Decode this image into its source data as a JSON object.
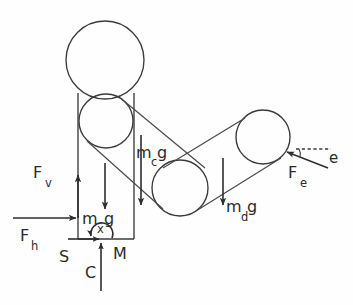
{
  "diagram": {
    "type": "free-body-diagram",
    "background_color": "#fefefe",
    "stroke_color": "#3a3a3a",
    "labels": {
      "f_v": {
        "base": "F",
        "sub": "v",
        "text": "Fv"
      },
      "f_h": {
        "base": "F",
        "sub": "h",
        "text": "Fh"
      },
      "f_e": {
        "base": "F",
        "sub": "e",
        "text": "Fe"
      },
      "m_x_g": {
        "base": "m",
        "sub": "x",
        "tail": "g",
        "text": "mxg"
      },
      "m_c_g": {
        "base": "m",
        "sub": "c",
        "tail": "g",
        "text": "mcg"
      },
      "m_d_g": {
        "base": "m",
        "sub": "d",
        "tail": "g",
        "text": "mdg"
      },
      "s": {
        "text": "S"
      },
      "m_moment": {
        "text": "M"
      },
      "c": {
        "text": "C"
      },
      "e_angle": {
        "text": "e"
      }
    },
    "forces": [
      {
        "name": "F_v",
        "label": "Fv",
        "direction": "up",
        "applied_at": "left-edge-of-column"
      },
      {
        "name": "F_h",
        "label": "Fh",
        "direction": "right",
        "applied_at": "left-edge-of-column"
      },
      {
        "name": "m_x_g",
        "label": "mxg",
        "direction": "down",
        "applied_at": "column-center"
      },
      {
        "name": "m_c_g",
        "label": "mcg",
        "direction": "down",
        "applied_at": "link-c-center"
      },
      {
        "name": "m_d_g",
        "label": "mdg",
        "direction": "down",
        "applied_at": "link-d-center"
      },
      {
        "name": "F_e",
        "label": "Fe",
        "direction": "up-left",
        "applied_at": "end-pulley"
      },
      {
        "name": "C",
        "label": "C",
        "direction": "up",
        "applied_at": "column-base"
      },
      {
        "name": "S",
        "label": "S",
        "direction": "none",
        "applied_at": "column-base-left"
      },
      {
        "name": "M",
        "label": "M",
        "direction": "moment-arc",
        "applied_at": "column-base"
      }
    ],
    "bodies": [
      {
        "name": "head-circle",
        "cx": 105,
        "cy": 60,
        "r": 39
      },
      {
        "name": "upper-pulley",
        "cx": 106,
        "cy": 121,
        "r": 27
      },
      {
        "name": "middle-pulley",
        "cx": 180,
        "cy": 188,
        "r": 28
      },
      {
        "name": "end-pulley",
        "cx": 263,
        "cy": 137,
        "r": 27
      }
    ],
    "annotations": {
      "angle_marker": "e",
      "angle_style": "dashed-reference-line"
    }
  }
}
